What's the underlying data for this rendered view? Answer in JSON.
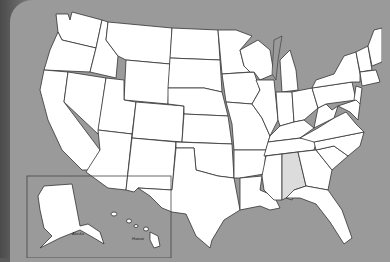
{
  "map": {
    "title": "United States map",
    "highlighted_state": "Alabama",
    "highlight_color": "#dcdcdc",
    "state_fill": "#ffffff",
    "background_color": "#9a9a9a",
    "inset": {
      "labels": [
        "Alaska",
        "Hawaii"
      ]
    }
  }
}
